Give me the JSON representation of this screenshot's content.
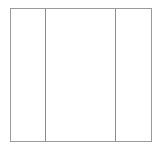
{
  "diagram": {
    "shape": "rectangle",
    "columns": 3,
    "divider_positions_px": [
      34,
      104
    ],
    "stroke_color": "#9a9a9a",
    "divider_color": "#8a8a8a",
    "background": "#ffffff"
  }
}
